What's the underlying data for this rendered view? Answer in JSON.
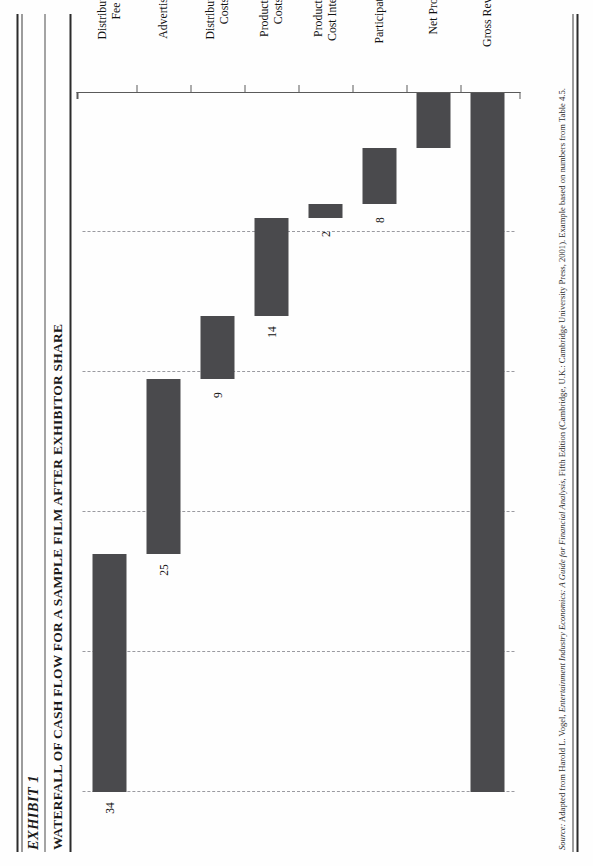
{
  "header": {
    "exhibit_label": "EXHIBIT 1",
    "title": "WATERFALL OF CASH FLOW FOR A SAMPLE FILM AFTER EXHIBITOR SHARE"
  },
  "source": {
    "prefix": "Source:",
    "text_before_book": " Adapted from Harold L. Vogel, ",
    "book": "Entertainment Industry Economics: A Guide for Financial Analysis",
    "text_after_book": ", Fifth Edition (Cambridge, U.K.: Cambridge University Press, 2001). Example based on numbers from Table 4.5."
  },
  "colors": {
    "bar": "#4a4a4d",
    "gridline": "#9a9aa0",
    "axis": "#5a5a5a",
    "rule": "#2b2b2b",
    "text": "#111111"
  },
  "chart_data": {
    "type": "bar",
    "subtype": "waterfall",
    "orientation": "horizontal",
    "title": "WATERFALL OF CASH FLOW FOR A SAMPLE FILM AFTER EXHIBITOR SHARE",
    "xlabel": "",
    "ylabel": "",
    "xlim": [
      0,
      100
    ],
    "grid": true,
    "gridlines": [
      0,
      20,
      40,
      60,
      80,
      100
    ],
    "legend": "none",
    "categories": [
      "Distribution\nFee",
      "Advertising",
      "Distribution\nCosts",
      "Production\nCosts",
      "Production\nCost Interest",
      "Participations",
      "Net Profit",
      "Gross Revenue"
    ],
    "values": [
      34,
      25,
      9,
      14,
      2,
      8,
      8,
      100
    ],
    "labels": [
      "34",
      "25",
      "9",
      "14",
      "2",
      "8",
      "",
      ""
    ],
    "bars": [
      {
        "category": "Distribution\nFee",
        "label": "34",
        "start": 66,
        "end": 100,
        "value": 34
      },
      {
        "category": "Advertising",
        "label": "25",
        "start": 41,
        "end": 66,
        "value": 25
      },
      {
        "category": "Distribution\nCosts",
        "label": "9",
        "start": 32,
        "end": 41,
        "value": 9
      },
      {
        "category": "Production\nCosts",
        "label": "14",
        "start": 18,
        "end": 32,
        "value": 14
      },
      {
        "category": "Production\nCost Interest",
        "label": "2",
        "start": 16,
        "end": 18,
        "value": 2
      },
      {
        "category": "Participations",
        "label": "8",
        "start": 8,
        "end": 16,
        "value": 8
      },
      {
        "category": "Net Profit",
        "label": "",
        "start": 0,
        "end": 8,
        "value": 8
      },
      {
        "category": "Gross Revenue",
        "label": "",
        "start": 0,
        "end": 100,
        "value": 100
      }
    ]
  }
}
